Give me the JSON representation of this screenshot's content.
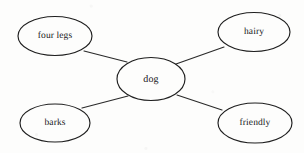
{
  "diagram": {
    "type": "concept-map",
    "background_color": "#fdfdfc",
    "stroke_color": "#1f1f1f",
    "text_color": "#16161a",
    "nodes": [
      {
        "id": "four-legs",
        "label": "four legs",
        "cx": 55,
        "cy": 36,
        "rx": 37,
        "ry": 19.5
      },
      {
        "id": "hairy",
        "label": "hairy",
        "cx": 254,
        "cy": 32,
        "rx": 36,
        "ry": 19.5
      },
      {
        "id": "dog",
        "label": "dog",
        "cx": 151,
        "cy": 79,
        "rx": 34,
        "ry": 21.5
      },
      {
        "id": "barks",
        "label": "barks",
        "cx": 55,
        "cy": 123,
        "rx": 35,
        "ry": 19
      },
      {
        "id": "friendly",
        "label": "friendly",
        "cx": 255,
        "cy": 123,
        "rx": 37,
        "ry": 20
      }
    ],
    "edges": [
      {
        "id": "dog-four-legs",
        "from": "dog",
        "to": "four-legs",
        "x1": 127,
        "y1": 62,
        "x2": 84,
        "y2": 51
      },
      {
        "id": "dog-hairy",
        "from": "dog",
        "to": "hairy",
        "x1": 176,
        "y1": 64,
        "x2": 224,
        "y2": 47
      },
      {
        "id": "dog-barks",
        "from": "dog",
        "to": "barks",
        "x1": 128,
        "y1": 96,
        "x2": 82,
        "y2": 108
      },
      {
        "id": "dog-friendly",
        "from": "dog",
        "to": "friendly",
        "x1": 177,
        "y1": 95,
        "x2": 222,
        "y2": 110
      }
    ]
  }
}
